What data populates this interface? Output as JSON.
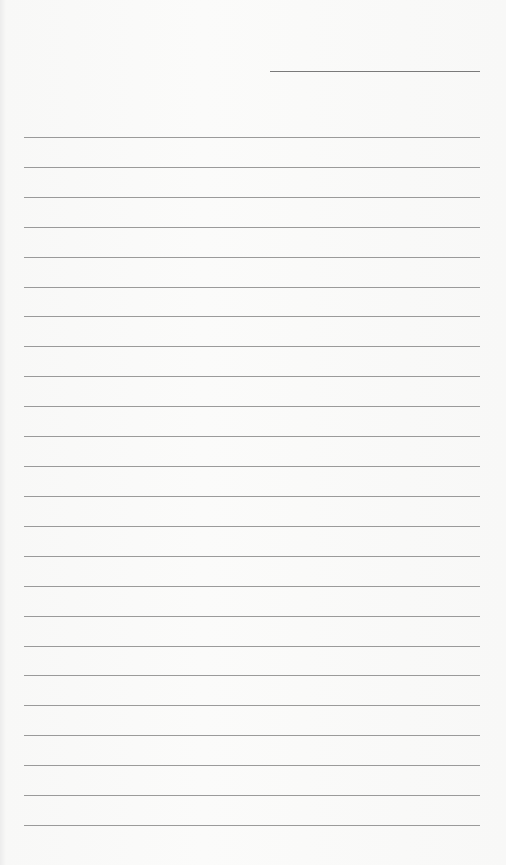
{
  "page": {
    "type": "lined-writing-sheet",
    "background_color": "#f7f7f6",
    "line_color": "#8a8a8a"
  },
  "header_line": {
    "x": 270,
    "y": 71,
    "width": 210
  },
  "ruled_lines": {
    "count": 24,
    "x": 24,
    "width": 456,
    "first_y": 137,
    "last_y": 825
  }
}
